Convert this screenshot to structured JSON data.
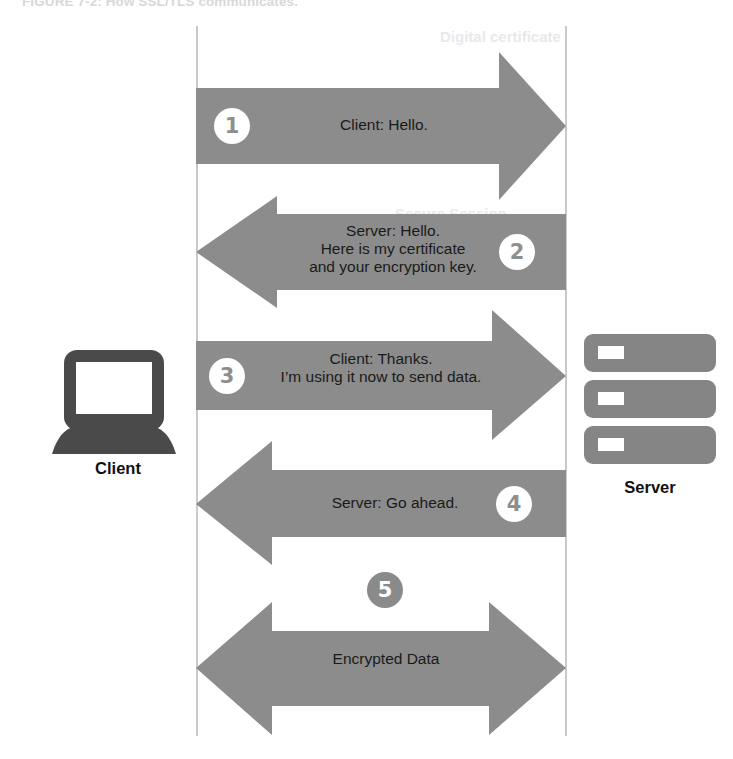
{
  "figure": {
    "caption": "FIGURE 7-2: How SSL/TLS communicates.",
    "ghost_right_top": "Digital certificate",
    "ghost_mid": "Secure Session",
    "background_color": "#ffffff",
    "arrow_color": "#8c8c8c",
    "device_color": "#4a4a4a",
    "server_color": "#858585",
    "lifeline_color": "#c9c9cc",
    "text_color": "#1a1a1a"
  },
  "nodes": {
    "client": {
      "label": "Client",
      "icon": "laptop-icon"
    },
    "server": {
      "label": "Server",
      "icon": "server-rack-icon"
    }
  },
  "steps": [
    {
      "number": "1",
      "direction": "right",
      "badge_side": "left",
      "badge_style": "light",
      "message": "Client: Hello."
    },
    {
      "number": "2",
      "direction": "left",
      "badge_side": "right",
      "badge_style": "light",
      "message": "Server: Hello.\nHere is my certificate\nand your encryption key."
    },
    {
      "number": "3",
      "direction": "right",
      "badge_side": "left",
      "badge_style": "light",
      "message": "Client: Thanks.\nI’m using it now to send data."
    },
    {
      "number": "4",
      "direction": "left",
      "badge_side": "right",
      "badge_style": "light",
      "message": "Server: Go ahead."
    },
    {
      "number": "5",
      "direction": "both",
      "badge_side": "above",
      "badge_style": "dark",
      "message": "Encrypted Data"
    }
  ]
}
